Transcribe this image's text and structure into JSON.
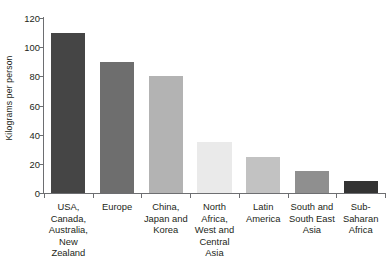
{
  "chart_data": {
    "type": "bar",
    "title": "",
    "subtitle": "",
    "xlabel": "",
    "ylabel": "Kilograms per person",
    "ylim": [
      0,
      120
    ],
    "yticks": [
      0,
      20,
      40,
      60,
      80,
      100,
      120
    ],
    "grid": false,
    "legend": false,
    "categories": [
      "USA,\nCanada,\nAustralia,\nNew\nZealand",
      "Europe",
      "China,\nJapan and\nKorea",
      "North\nAfrica,\nWest and\nCentral\nAsia",
      "Latin\nAmerica",
      "South and\nSouth East\nAsia",
      "Sub-\nSaharan\nAfrica"
    ],
    "values": [
      110,
      90,
      80.5,
      35,
      25,
      15,
      8.5
    ],
    "bar_colors": [
      "#454545",
      "#6e6e6e",
      "#b3b3b3",
      "#eaeaea",
      "#c2c2c2",
      "#8f8f8f",
      "#333333"
    ]
  },
  "axis": {
    "y_title": "Kilograms per person",
    "tick_labels": [
      "0",
      "20",
      "40",
      "60",
      "80",
      "100",
      "120"
    ]
  },
  "categories": [
    {
      "lines": [
        "USA,",
        "Canada,",
        "Australia,",
        "New",
        "Zealand"
      ]
    },
    {
      "lines": [
        "Europe"
      ]
    },
    {
      "lines": [
        "China,",
        "Japan and",
        "Korea"
      ]
    },
    {
      "lines": [
        "North",
        "Africa,",
        "West and",
        "Central",
        "Asia"
      ]
    },
    {
      "lines": [
        "Latin",
        "America"
      ]
    },
    {
      "lines": [
        "South and",
        "South East",
        "Asia"
      ]
    },
    {
      "lines": [
        "Sub-",
        "Saharan",
        "Africa"
      ]
    }
  ]
}
